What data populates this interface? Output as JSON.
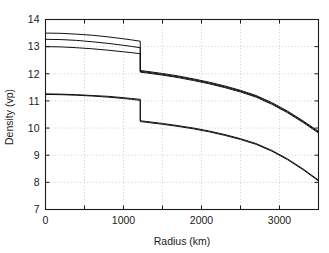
{
  "figure": {
    "background_color": "#ffffff",
    "frame_color": "#1a1a1a",
    "grid_color": "#b9b9b9",
    "curve_color": "#111111"
  },
  "chart_data": {
    "type": "line",
    "title": "",
    "subtitle": "",
    "xlabel": "Radius (km)",
    "ylabel": "Density (vp)",
    "xlim": [
      0,
      3500
    ],
    "ylim": [
      7,
      14
    ],
    "xticks": [
      0,
      1000,
      2000,
      3000
    ],
    "xtick_labels": [
      "0",
      "1000",
      "2000",
      "3000"
    ],
    "xticks_minor": [
      500,
      1500,
      2500,
      3500
    ],
    "yticks": [
      7,
      8,
      9,
      10,
      11,
      12,
      13,
      14
    ],
    "ytick_labels": [
      "7",
      "8",
      "9",
      "10",
      "11",
      "12",
      "13",
      "14"
    ],
    "grid": true,
    "grid_style": "dotted",
    "legend": "none",
    "annotations": [],
    "discontinuity_radius": 1215,
    "series": [
      {
        "name": "upper-model-1",
        "x": [
          0,
          200,
          400,
          600,
          800,
          1000,
          1100,
          1215,
          1215,
          1300,
          1500,
          1700,
          1900,
          2100,
          2300,
          2500,
          2700,
          2900,
          3100,
          3300,
          3500
        ],
        "values": [
          13.5,
          13.49,
          13.46,
          13.42,
          13.36,
          13.29,
          13.25,
          13.2,
          12.12,
          12.09,
          12.01,
          11.92,
          11.81,
          11.69,
          11.55,
          11.39,
          11.2,
          10.94,
          10.63,
          10.27,
          9.88
        ]
      },
      {
        "name": "upper-model-2",
        "x": [
          0,
          200,
          400,
          600,
          800,
          1000,
          1100,
          1215,
          1215,
          1300,
          1500,
          1700,
          1900,
          2100,
          2300,
          2500,
          2700,
          2900,
          3100,
          3300,
          3500
        ],
        "values": [
          13.27,
          13.26,
          13.23,
          13.18,
          13.12,
          13.05,
          13.01,
          12.96,
          12.09,
          12.06,
          11.98,
          11.89,
          11.78,
          11.66,
          11.52,
          11.36,
          11.17,
          10.91,
          10.6,
          10.24,
          9.85
        ]
      },
      {
        "name": "upper-model-3",
        "x": [
          0,
          200,
          400,
          600,
          800,
          1000,
          1100,
          1215,
          1215,
          1300,
          1500,
          1700,
          1900,
          2100,
          2300,
          2500,
          2700,
          2900,
          3100,
          3300,
          3500
        ],
        "values": [
          13.0,
          12.99,
          12.96,
          12.92,
          12.87,
          12.81,
          12.78,
          12.74,
          12.06,
          12.03,
          11.95,
          11.86,
          11.75,
          11.63,
          11.49,
          11.33,
          11.14,
          10.88,
          10.57,
          10.21,
          9.82
        ]
      },
      {
        "name": "lower-model-1",
        "x": [
          0,
          200,
          400,
          600,
          800,
          1000,
          1100,
          1215,
          1215,
          1300,
          1500,
          1700,
          1900,
          2100,
          2300,
          2500,
          2700,
          2900,
          3100,
          3300,
          3500
        ],
        "values": [
          11.26,
          11.25,
          11.23,
          11.2,
          11.17,
          11.12,
          11.09,
          11.06,
          10.27,
          10.24,
          10.17,
          10.09,
          10.0,
          9.89,
          9.76,
          9.61,
          9.43,
          9.18,
          8.87,
          8.5,
          8.08
        ]
      },
      {
        "name": "lower-model-2",
        "x": [
          0,
          200,
          400,
          600,
          800,
          1000,
          1100,
          1215,
          1215,
          1300,
          1500,
          1700,
          1900,
          2100,
          2300,
          2500,
          2700,
          2900,
          3100,
          3300,
          3500
        ],
        "values": [
          11.24,
          11.23,
          11.21,
          11.18,
          11.14,
          11.09,
          11.06,
          11.02,
          10.24,
          10.21,
          10.14,
          10.06,
          9.97,
          9.86,
          9.73,
          9.58,
          9.4,
          9.15,
          8.84,
          8.47,
          8.05
        ]
      }
    ]
  }
}
